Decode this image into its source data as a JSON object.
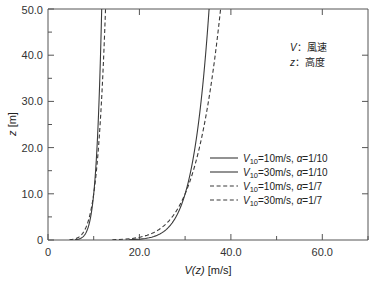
{
  "chart_data": {
    "type": "line",
    "title": "",
    "xlabel": "V(z) [m/s]",
    "ylabel": "z [m]",
    "xlim": [
      0,
      70
    ],
    "ylim": [
      0,
      50
    ],
    "grid": false,
    "legend_position": "middle-right",
    "x_ticks_major": [
      0,
      20,
      40,
      60
    ],
    "x_ticklabels": [
      "0",
      "20.0",
      "40.0",
      "60.0"
    ],
    "x_ticks_minor": [
      10,
      30,
      50,
      70
    ],
    "y_ticks_major": [
      0,
      10,
      20,
      30,
      40,
      50
    ],
    "y_ticklabels": [
      "0",
      "10.0",
      "20.0",
      "30.0",
      "40.0",
      "50.0"
    ],
    "y_ticks_minor": [
      5,
      15,
      25,
      35,
      45
    ],
    "equation": "V(z) = V10 * (z/10)^a",
    "series": [
      {
        "name": "V10=10m/s, a=1/10",
        "style": "solid",
        "V10": 10,
        "alpha": 0.1,
        "z": [
          0.5,
          1,
          2,
          3,
          4,
          5,
          6,
          7,
          8,
          9,
          10,
          12,
          15,
          18,
          20,
          25,
          30,
          35,
          40,
          45,
          50
        ],
        "v": [
          7.41,
          7.94,
          8.51,
          8.87,
          9.12,
          9.33,
          9.5,
          9.64,
          9.76,
          9.88,
          10.0,
          10.18,
          10.41,
          10.6,
          10.72,
          10.96,
          11.16,
          11.32,
          11.49,
          11.61,
          11.75
        ]
      },
      {
        "name": "V10=30m/s, a=1/10",
        "style": "solid",
        "V10": 30,
        "alpha": 0.1,
        "z": [
          0.5,
          1,
          2,
          3,
          4,
          5,
          6,
          7,
          8,
          9,
          10,
          12,
          15,
          18,
          20,
          25,
          30,
          35,
          40,
          45,
          50
        ],
        "v": [
          22.2,
          23.8,
          25.5,
          26.6,
          27.4,
          28.0,
          28.5,
          28.9,
          29.3,
          29.6,
          30.0,
          30.5,
          31.2,
          31.8,
          32.2,
          32.9,
          33.5,
          34.0,
          34.5,
          34.8,
          35.2
        ]
      },
      {
        "name": "V10=10m/s, a=1/7",
        "style": "dashed",
        "V10": 10,
        "alpha": 0.142857,
        "z": [
          0.5,
          1,
          2,
          3,
          4,
          5,
          6,
          7,
          8,
          9,
          10,
          12,
          15,
          18,
          20,
          25,
          30,
          35,
          40,
          45,
          50
        ],
        "v": [
          6.46,
          7.2,
          7.95,
          8.42,
          8.77,
          9.04,
          9.26,
          9.45,
          9.61,
          9.76,
          10.0,
          10.26,
          10.59,
          10.86,
          11.02,
          11.37,
          11.66,
          11.9,
          12.11,
          12.3,
          12.46
        ]
      },
      {
        "name": "V10=30m/s, a=1/7",
        "style": "dashed",
        "V10": 30,
        "alpha": 0.142857,
        "z": [
          0.5,
          1,
          2,
          3,
          4,
          5,
          6,
          7,
          8,
          9,
          10,
          12,
          15,
          18,
          20,
          25,
          30,
          35,
          40,
          45,
          50
        ],
        "v": [
          19.4,
          21.6,
          23.8,
          25.3,
          26.3,
          27.1,
          27.8,
          28.3,
          28.8,
          29.3,
          30.0,
          30.8,
          31.8,
          32.6,
          33.1,
          34.1,
          34.9,
          35.7,
          36.3,
          36.9,
          37.4
        ]
      }
    ]
  },
  "legend": {
    "entries": [
      {
        "v10": "10m/s",
        "alpha": "1/10",
        "style": "solid"
      },
      {
        "v10": "30m/s",
        "alpha": "1/10",
        "style": "solid"
      },
      {
        "v10": "10m/s",
        "alpha": "1/7",
        "style": "dashed"
      },
      {
        "v10": "30m/s",
        "alpha": "1/7",
        "style": "dashed"
      }
    ]
  },
  "annotation": {
    "line1_symbol": "V",
    "line1_text": "：風速",
    "line2_symbol": "z",
    "line2_text": "：高度"
  },
  "axes": {
    "x_title_var": "V(z)",
    "x_title_unit": "[m/s]",
    "y_title_var": "z",
    "y_title_unit": "[m]"
  }
}
